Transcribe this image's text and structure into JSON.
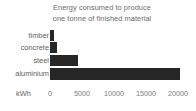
{
  "chart_data": {
    "type": "bar",
    "orientation": "horizontal",
    "title": "Energy consumed to produce one tonne of finished material",
    "title_lines": [
      "Energy consumed to produce",
      "one tonne of finished material"
    ],
    "categories": [
      "timber",
      "concrete",
      "steel",
      "aluminium"
    ],
    "values": [
      550,
      1100,
      4400,
      20300
    ],
    "xlabel": "kWh",
    "ylabel": "",
    "xlim": [
      0,
      21000
    ],
    "xticks": [
      0,
      5000,
      10000,
      15000,
      20000
    ],
    "xtick_labels": [
      "0",
      "5000",
      "10000",
      "15000",
      "20000"
    ],
    "grid": false,
    "legend": false,
    "bar_color": "#262626",
    "text_color": "#5e5e5e",
    "background": "#ffffff"
  },
  "axis": {
    "unit_label": "kWh"
  }
}
